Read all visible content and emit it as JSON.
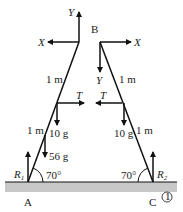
{
  "diagram": {
    "points": {
      "top": "B",
      "left_base": "A",
      "right_base": "C"
    },
    "forces": {
      "left_top_vertical": "Y",
      "left_top_horizontal": "X",
      "right_top_horizontal": "X",
      "right_top_vertical": "Y",
      "tension_left": "T",
      "tension_right": "T",
      "weight_left": "10 g",
      "weight_right": "10 g",
      "load": "56 g",
      "reaction_left": "R",
      "reaction_left_sub": "1",
      "reaction_right": "R",
      "reaction_right_sub": "2"
    },
    "lengths": {
      "left_upper": "1 m",
      "left_lower": "1 m",
      "right_upper": "1 m",
      "right_lower": "1 m"
    },
    "angles": {
      "left": "70°",
      "right": "70°"
    },
    "marker": "1",
    "colors": {
      "line": "#111111",
      "ground": "#c8c8c8",
      "text": "#222222"
    }
  }
}
